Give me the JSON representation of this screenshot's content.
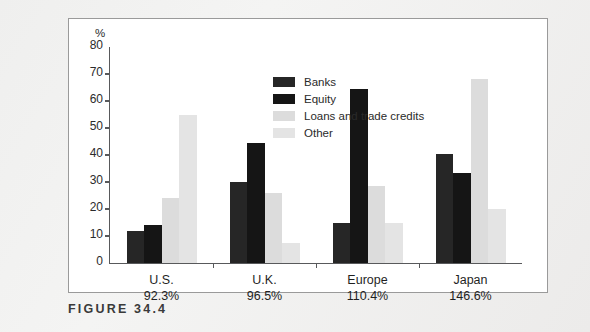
{
  "caption": "FIGURE 34.4",
  "chart_data": {
    "type": "bar",
    "title": "",
    "subtitle": "",
    "xlabel": "",
    "ylabel": "%",
    "ylim": [
      0,
      80
    ],
    "yticks": [
      0,
      10,
      20,
      30,
      40,
      50,
      60,
      70,
      80
    ],
    "grid": false,
    "legend_position": "inside-top-left",
    "categories": [
      "U.S.",
      "U.K.",
      "Europe",
      "Japan"
    ],
    "category_sublabels": [
      "92.3%",
      "96.5%",
      "110.4%",
      "146.6%"
    ],
    "series": [
      {
        "name": "Banks",
        "color": "#262626",
        "values": [
          12,
          30,
          15,
          40.5
        ]
      },
      {
        "name": "Equity",
        "color": "#151515",
        "values": [
          14,
          44.5,
          64.5,
          33.5
        ]
      },
      {
        "name": "Loans and trade credits",
        "color": "#dcdcdc",
        "values": [
          24,
          26,
          28.5,
          68
        ]
      },
      {
        "name": "Other",
        "color": "#e4e4e4",
        "values": [
          55,
          7.5,
          15,
          20
        ]
      }
    ]
  },
  "legend": [
    {
      "label": "Banks",
      "color": "#262626"
    },
    {
      "label": "Equity",
      "color": "#151515"
    },
    {
      "label": "Loans and trade credits",
      "color": "#dcdcdc"
    },
    {
      "label": "Other",
      "color": "#e4e4e4"
    }
  ],
  "axis": {
    "unit_label": "%",
    "ticks": [
      "80",
      "70",
      "60",
      "50",
      "40",
      "30",
      "20",
      "10",
      "0"
    ]
  },
  "groups": [
    {
      "label": "U.S.",
      "sublabel": "92.3%"
    },
    {
      "label": "U.K.",
      "sublabel": "96.5%"
    },
    {
      "label": "Europe",
      "sublabel": "110.4%"
    },
    {
      "label": "Japan",
      "sublabel": "146.6%"
    }
  ]
}
